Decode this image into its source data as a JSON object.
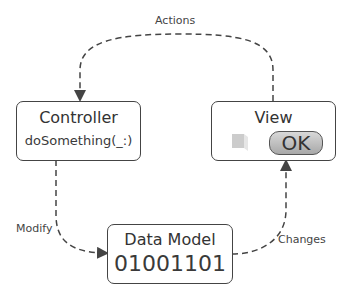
{
  "diagram": {
    "nodes": {
      "controller": {
        "title": "Controller",
        "subtitle": "doSomething(_:)"
      },
      "view": {
        "title": "View",
        "button_label": "OK"
      },
      "model": {
        "title": "Data Model",
        "value": "01001101"
      }
    },
    "edges": {
      "actions": {
        "label": "Actions",
        "from": "View",
        "to": "Controller"
      },
      "modify": {
        "label": "Modify",
        "from": "Controller",
        "to": "Data Model"
      },
      "changes": {
        "label": "Changes",
        "from": "Data Model",
        "to": "View"
      }
    },
    "colors": {
      "stroke": "#444444",
      "button": "#b8b8b8"
    }
  }
}
